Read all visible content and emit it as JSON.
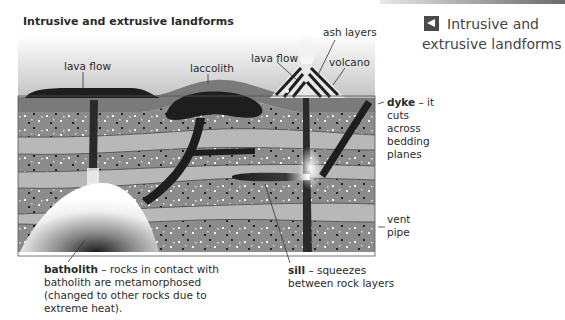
{
  "figure": {
    "title": "Intrusive and extrusive landforms",
    "side_caption": {
      "icon": "left-triangle-arrow-icon",
      "line1": "Intrusive and",
      "line2": "extrusive landforms"
    }
  },
  "labels": {
    "lava_flow_left": "lava flow",
    "laccolith": "laccolith",
    "lava_flow_right": "lava flow",
    "ash_layers": "ash layers",
    "volcano": "volcano"
  },
  "notes": {
    "dyke": {
      "term": "dyke",
      "text": " – it",
      "lines": [
        "cuts",
        "across",
        "bedding",
        "planes"
      ]
    },
    "vent_pipe": {
      "lines": [
        "vent",
        "pipe"
      ]
    },
    "sill": {
      "term": "sill",
      "text": " – squeezes",
      "line2": "between rock layers"
    },
    "batholith": {
      "term": "batholith",
      "text": " – rocks in contact with",
      "line2": "batholith are metamorphosed",
      "line3": "(changed to other rocks due to",
      "line4": "extreme heat)."
    }
  },
  "colors": {
    "magma": "#1e1e1e",
    "light_rock": "#b8b8b8",
    "speckled_rock": "#8c8c8c",
    "surface_layer": "#7a7a7a",
    "text": "#2a2a2a"
  }
}
